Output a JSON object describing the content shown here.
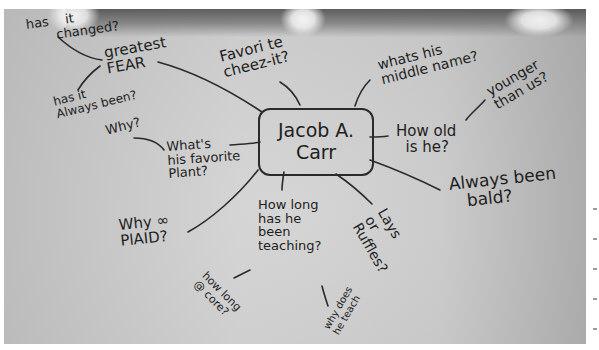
{
  "whiteboard": {
    "center_node": {
      "line1": "Jacob A.",
      "line2": "Carr"
    },
    "nodes": {
      "greatest_fear": "greatest\nFEAR",
      "has_it_changed": "has    it\n       changed?",
      "has_it_always_been": "has it\nAlways been?",
      "why": "Why?",
      "favorite_cheezit": "Favori te\ncheez-it?",
      "middle_name": "whats his\nmiddle name?",
      "how_old": "How old\n  is he?",
      "younger_than_us": "younger\nthan us?",
      "favorite_plant": "What's\nhis favorite\nPlant?",
      "why_plaid": "Why ∞\nPlAID?",
      "how_long_teaching": "How long\nhas he\nbeen\nteaching?",
      "lays_or_ruffles": "Lays\nor\nRuffles?",
      "always_been_bald": "Always been\n   bald?",
      "how_long_core": "how long\n@ core?",
      "why_does_he_teach": "why does\nhe teach"
    },
    "colors": {
      "ink": "#1e1e1e",
      "board": "#cfcfcf",
      "frame": "#ffffff"
    }
  }
}
